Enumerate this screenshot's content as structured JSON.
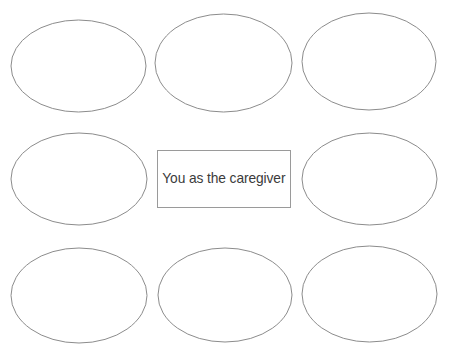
{
  "diagram": {
    "type": "mind-map-worksheet",
    "background_color": "#ffffff",
    "shape_stroke_color": "#8c8c8c",
    "box_stroke_color": "#9a9a9a",
    "text_color": "#3b3b3b",
    "center": {
      "label": "You as the caregiver",
      "shape": "rectangle",
      "x": 157,
      "y": 150,
      "width": 134,
      "height": 58
    },
    "nodes": [
      {
        "id": "node-top-left",
        "label": "",
        "shape": "ellipse",
        "cx": 78.5,
        "cy": 66,
        "rx": 67.5,
        "ry": 46
      },
      {
        "id": "node-top-center",
        "label": "",
        "shape": "ellipse",
        "cx": 223.5,
        "cy": 63,
        "rx": 68.5,
        "ry": 49
      },
      {
        "id": "node-top-right",
        "label": "",
        "shape": "ellipse",
        "cx": 369,
        "cy": 61.5,
        "rx": 67,
        "ry": 48.5
      },
      {
        "id": "node-middle-left",
        "label": "",
        "shape": "ellipse",
        "cx": 79,
        "cy": 179,
        "rx": 68,
        "ry": 46
      },
      {
        "id": "node-middle-right",
        "label": "",
        "shape": "ellipse",
        "cx": 369.5,
        "cy": 179,
        "rx": 67.5,
        "ry": 46
      },
      {
        "id": "node-bottom-left",
        "label": "",
        "shape": "ellipse",
        "cx": 79,
        "cy": 295.5,
        "rx": 68,
        "ry": 47.5
      },
      {
        "id": "node-bottom-center",
        "label": "",
        "shape": "ellipse",
        "cx": 225,
        "cy": 295,
        "rx": 67,
        "ry": 47
      },
      {
        "id": "node-bottom-right",
        "label": "",
        "shape": "ellipse",
        "cx": 369.5,
        "cy": 294,
        "rx": 67.5,
        "ry": 48
      }
    ]
  }
}
